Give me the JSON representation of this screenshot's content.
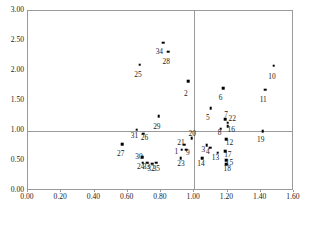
{
  "chart_data": {
    "type": "scatter",
    "title": "",
    "xlabel": "",
    "ylabel": "",
    "xlim": [
      0.0,
      1.6
    ],
    "ylim": [
      0.0,
      3.0
    ],
    "xticks": [
      "0.00",
      "0.20",
      "0.40",
      "0.60",
      "0.80",
      "1.00",
      "1.20",
      "1.40",
      "1.60"
    ],
    "yticks": [
      "0.00",
      "0.50",
      "1.00",
      "1.50",
      "2.00",
      "2.50",
      "3.00"
    ],
    "xtick_values": [
      0.0,
      0.2,
      0.4,
      0.6,
      0.8,
      1.0,
      1.2,
      1.4,
      1.6
    ],
    "ytick_values": [
      0.0,
      0.5,
      1.0,
      1.5,
      2.0,
      2.5,
      3.0
    ],
    "grid": false,
    "reference_lines": [
      {
        "axis": "y",
        "value": 1.0
      },
      {
        "axis": "x",
        "value": 1.0
      }
    ],
    "legend": null,
    "point_labels_position": "below-left",
    "points": [
      {
        "label": "1",
        "x": 0.925,
        "y": 0.685,
        "lx": 0.893,
        "ly": 0.655
      },
      {
        "label": "2",
        "x": 0.965,
        "y": 1.83,
        "lx": 0.95,
        "ly": 1.62
      },
      {
        "label": "3",
        "x": 1.075,
        "y": 0.76,
        "lx": 1.055,
        "ly": 0.69
      },
      {
        "label": "4",
        "x": 1.095,
        "y": 0.72,
        "lx": 1.082,
        "ly": 0.65
      },
      {
        "label": "5",
        "x": 1.1,
        "y": 1.38,
        "lx": 1.082,
        "ly": 1.215
      },
      {
        "label": "6",
        "x": 1.175,
        "y": 1.715,
        "lx": 1.158,
        "ly": 1.545
      },
      {
        "label": "7",
        "x": 1.185,
        "y": 1.2,
        "lx": 1.192,
        "ly": 1.27
      },
      {
        "label": "8",
        "x": 1.16,
        "y": 1.04,
        "lx": 1.152,
        "ly": 0.96
      },
      {
        "label": "9",
        "x": 0.952,
        "y": 0.69,
        "lx": 0.962,
        "ly": 0.635
      },
      {
        "label": "10",
        "x": 1.478,
        "y": 2.09,
        "lx": 1.468,
        "ly": 1.905
      },
      {
        "label": "11",
        "x": 1.428,
        "y": 1.69,
        "lx": 1.415,
        "ly": 1.52
      },
      {
        "label": "12",
        "x": 1.192,
        "y": 0.865,
        "lx": 1.212,
        "ly": 0.8
      },
      {
        "label": "13",
        "x": 1.14,
        "y": 0.64,
        "lx": 1.128,
        "ly": 0.545
      },
      {
        "label": "14",
        "x": 1.048,
        "y": 0.545,
        "lx": 1.04,
        "ly": 0.45
      },
      {
        "label": "15",
        "x": 1.192,
        "y": 0.515,
        "lx": 1.212,
        "ly": 0.465
      },
      {
        "label": "16",
        "x": 1.202,
        "y": 1.08,
        "lx": 1.222,
        "ly": 1.01
      },
      {
        "label": "17",
        "x": 1.185,
        "y": 0.665,
        "lx": 1.202,
        "ly": 0.605
      },
      {
        "label": "18",
        "x": 1.192,
        "y": 0.45,
        "lx": 1.198,
        "ly": 0.375
      },
      {
        "label": "19",
        "x": 1.412,
        "y": 0.995,
        "lx": 1.4,
        "ly": 0.855
      },
      {
        "label": "20",
        "x": 0.985,
        "y": 0.88,
        "lx": 0.988,
        "ly": 0.945
      },
      {
        "label": "21",
        "x": 0.94,
        "y": 0.775,
        "lx": 0.92,
        "ly": 0.805
      },
      {
        "label": "22",
        "x": 1.202,
        "y": 1.135,
        "lx": 1.228,
        "ly": 1.195
      },
      {
        "label": "23",
        "x": 0.918,
        "y": 0.545,
        "lx": 0.92,
        "ly": 0.45
      },
      {
        "label": "24",
        "x": 0.69,
        "y": 0.47,
        "lx": 0.678,
        "ly": 0.4
      },
      {
        "label": "25",
        "x": 0.672,
        "y": 2.105,
        "lx": 0.662,
        "ly": 1.935
      },
      {
        "label": "26",
        "x": 0.692,
        "y": 0.955,
        "lx": 0.7,
        "ly": 0.88
      },
      {
        "label": "27",
        "x": 0.565,
        "y": 0.78,
        "lx": 0.558,
        "ly": 0.62
      },
      {
        "label": "28",
        "x": 0.845,
        "y": 2.325,
        "lx": 0.832,
        "ly": 2.155
      },
      {
        "label": "29",
        "x": 0.785,
        "y": 1.25,
        "lx": 0.775,
        "ly": 1.075
      },
      {
        "label": "30",
        "x": 0.688,
        "y": 0.565,
        "lx": 0.668,
        "ly": 0.575
      },
      {
        "label": "31",
        "x": 0.655,
        "y": 1.025,
        "lx": 0.64,
        "ly": 0.91
      },
      {
        "label": "32",
        "x": 0.748,
        "y": 0.455,
        "lx": 0.74,
        "ly": 0.36
      },
      {
        "label": "33",
        "x": 0.718,
        "y": 0.47,
        "lx": 0.712,
        "ly": 0.4
      },
      {
        "label": "34",
        "x": 0.812,
        "y": 2.47,
        "lx": 0.79,
        "ly": 2.32
      },
      {
        "label": "35",
        "x": 0.77,
        "y": 0.47,
        "lx": 0.772,
        "ly": 0.372
      }
    ]
  },
  "caption": {
    "text": ""
  }
}
